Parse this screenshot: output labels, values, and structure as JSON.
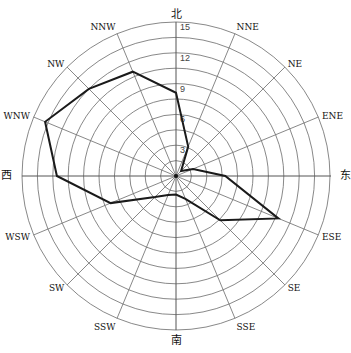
{
  "chart_data": {
    "type": "radar",
    "title": "",
    "center": [
      176,
      176
    ],
    "radius_px": 154,
    "rmax": 15,
    "ring_step": 1.5,
    "ring_count": 10,
    "radial_tick_labels": [
      "3",
      "6",
      "9",
      "12",
      "15"
    ],
    "directions": [
      "N",
      "NNE",
      "NE",
      "ENE",
      "E",
      "ESE",
      "SE",
      "SSE",
      "S",
      "SSW",
      "SW",
      "WSW",
      "W",
      "WNW",
      "NW",
      "NNW"
    ],
    "direction_labels": [
      "北",
      "NNE",
      "NE",
      "ENE",
      "东",
      "ESE",
      "SE",
      "SSE",
      "南",
      "SSW",
      "SW",
      "WSW",
      "西",
      "WNW",
      "NW",
      "NNW"
    ],
    "series": [
      {
        "name": "wind frequency",
        "values": [
          8.1,
          3.1,
          0.7,
          1.8,
          4.8,
          10.8,
          6.1,
          2.4,
          1.8,
          2.0,
          2.9,
          6.9,
          11.6,
          13.8,
          12.0,
          11.0
        ]
      }
    ],
    "grid": true,
    "legend": "none"
  }
}
